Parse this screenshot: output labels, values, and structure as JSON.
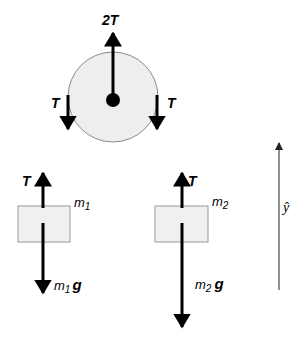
{
  "diagram": {
    "type": "free-body diagram",
    "colors": {
      "background": "#ffffff",
      "pulley_fill": "#eeeeee",
      "pulley_stroke": "#8a8a8a",
      "block_fill": "#f0f0f0",
      "block_stroke": "#999999",
      "arrow": "#000000"
    },
    "pulley": {
      "forces": {
        "up_label": "2T",
        "left_label": "T",
        "right_label": "T"
      }
    },
    "block1": {
      "mass_label": "m",
      "mass_sub": "1",
      "tension_label": "T",
      "weight_label_m": "m",
      "weight_label_sub": "1",
      "weight_label_g": "g"
    },
    "block2": {
      "mass_label": "m",
      "mass_sub": "2",
      "tension_label": "T",
      "weight_label_m": "m",
      "weight_label_sub": "2",
      "weight_label_g": "g"
    },
    "axis": {
      "label": "ŷ"
    }
  }
}
